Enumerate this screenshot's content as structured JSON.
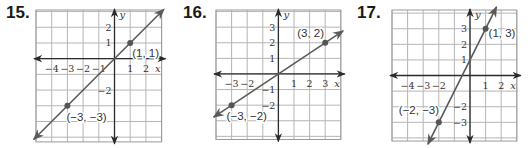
{
  "chart_data": [
    {
      "type": "line",
      "problem_number": "15.",
      "xlabel": "x",
      "ylabel": "y",
      "grid": true,
      "xlim": [
        -5,
        3
      ],
      "ylim": [
        -5.3,
        3.1
      ],
      "x_tick_labels": [
        {
          "v": -4,
          "t": "−4"
        },
        {
          "v": -3,
          "t": "−3"
        },
        {
          "v": -2,
          "t": "−2"
        },
        {
          "v": -1,
          "t": "−1"
        },
        {
          "v": 1,
          "t": "1"
        },
        {
          "v": 2,
          "t": "2"
        }
      ],
      "y_tick_labels": [
        {
          "v": 2,
          "t": "2"
        },
        {
          "v": 1,
          "t": "1"
        },
        {
          "v": -2,
          "t": "−2"
        }
      ],
      "points": [
        {
          "x": 1,
          "y": 1,
          "label": "(1, 1)",
          "label_dx": 2,
          "label_dy": 14
        },
        {
          "x": -3,
          "y": -3,
          "label": "(−3, −3)",
          "label_dx": -1,
          "label_dy": 15
        }
      ],
      "line": {
        "slope": 1,
        "intercept": 0
      }
    },
    {
      "type": "line",
      "problem_number": "16.",
      "xlabel": "x",
      "ylabel": "y",
      "grid": true,
      "xlim": [
        -4,
        4
      ],
      "ylim": [
        -4.2,
        4.1
      ],
      "x_tick_labels": [
        {
          "v": -3,
          "t": "−3"
        },
        {
          "v": -2,
          "t": "−2"
        },
        {
          "v": 1,
          "t": "1"
        },
        {
          "v": 2,
          "t": "2"
        },
        {
          "v": 3,
          "t": "3"
        }
      ],
      "y_tick_labels": [
        {
          "v": 3,
          "t": "3"
        },
        {
          "v": 2,
          "t": "2"
        },
        {
          "v": 1,
          "t": "1"
        },
        {
          "v": -1,
          "t": "−1"
        },
        {
          "v": -2,
          "t": "−2"
        }
      ],
      "points": [
        {
          "x": 3,
          "y": 2,
          "label": "(3, 2)",
          "label_dx": -28,
          "label_dy": -6
        },
        {
          "x": -3,
          "y": -2,
          "label": "(−3, −2)",
          "label_dx": -5,
          "label_dy": 15
        }
      ],
      "line": {
        "slope": 0.6667,
        "intercept": 0
      }
    },
    {
      "type": "line",
      "problem_number": "17.",
      "xlabel": "x",
      "ylabel": "y",
      "grid": true,
      "xlim": [
        -5,
        3
      ],
      "ylim": [
        -4.2,
        4.2
      ],
      "x_tick_labels": [
        {
          "v": -4,
          "t": "−4"
        },
        {
          "v": -3,
          "t": "−3"
        },
        {
          "v": -2,
          "t": "−2"
        },
        {
          "v": 1,
          "t": "1"
        },
        {
          "v": 2,
          "t": "2"
        }
      ],
      "y_tick_labels": [
        {
          "v": 3,
          "t": "3"
        },
        {
          "v": 2,
          "t": "2"
        },
        {
          "v": 1,
          "t": "1"
        },
        {
          "v": -2,
          "t": "−2"
        },
        {
          "v": -3,
          "t": "−3"
        }
      ],
      "points": [
        {
          "x": 1,
          "y": 3,
          "label": "(1, 3)",
          "label_dx": 3,
          "label_dy": 8
        },
        {
          "x": -2,
          "y": -3,
          "label": "(−2, −3)",
          "label_dx": -40,
          "label_dy": -8
        }
      ],
      "line": {
        "slope": 2,
        "intercept": 1
      }
    }
  ],
  "layout": {
    "panels": [
      {
        "left": 0,
        "number_left": 6,
        "grid_left": 36,
        "grid_top": 10,
        "cell": 15.7
      },
      {
        "left": 0,
        "number_left": 183,
        "grid_left": 216,
        "grid_top": 10,
        "cell": 15.6
      },
      {
        "left": 0,
        "number_left": 357,
        "grid_left": 392,
        "grid_top": 10,
        "cell": 15.6
      }
    ],
    "colors": {
      "grid": "#b5b5b5",
      "grid_border": "#9a9a9a",
      "axis": "#2b2b2b",
      "line": "#5a5a5a",
      "point": "#555555"
    }
  }
}
